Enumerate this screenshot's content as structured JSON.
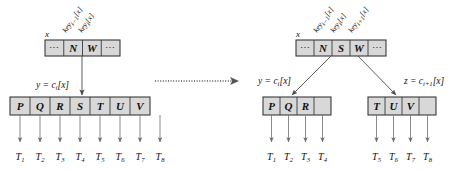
{
  "figure": {
    "title": "B-tree node split diagram",
    "transition_arrow": "dotted-right-arrow",
    "colors": {
      "box_fill": "#d8d8d8",
      "box_stroke": "#3a3a3a",
      "edge": "#4a4a4a",
      "leaf_pointer": "#6e6e6e",
      "text": "#111111",
      "background": "#ffffff"
    },
    "ellipsis": "⋯"
  },
  "left_panel": {
    "name": "before-split",
    "pointer_label": "x",
    "key_labels": [
      {
        "text": "key",
        "sub": "i−1",
        "suffix": "[x]"
      },
      {
        "text": "key",
        "sub": "i",
        "suffix": "[x]"
      }
    ],
    "parent_node": {
      "name": "parent-node",
      "cells": [
        "N",
        "W"
      ],
      "lead_ellipsis": "⋯",
      "trail_ellipsis": "⋯"
    },
    "child_edge_label": {
      "lhs": "y",
      "eq": "=",
      "rhs": "c",
      "sub": "i",
      "suffix": "[x]"
    },
    "child_node": {
      "name": "child-node-full",
      "cells": [
        "P",
        "Q",
        "R",
        "S",
        "T",
        "U",
        "V"
      ]
    },
    "leaves": [
      {
        "text": "T",
        "sub": "1"
      },
      {
        "text": "T",
        "sub": "2"
      },
      {
        "text": "T",
        "sub": "3"
      },
      {
        "text": "T",
        "sub": "4"
      },
      {
        "text": "T",
        "sub": "5"
      },
      {
        "text": "T",
        "sub": "6"
      },
      {
        "text": "T",
        "sub": "7"
      },
      {
        "text": "T",
        "sub": "8"
      }
    ]
  },
  "right_panel": {
    "name": "after-split",
    "pointer_label": "x",
    "key_labels": [
      {
        "text": "key",
        "sub": "i−1",
        "suffix": "[x]"
      },
      {
        "text": "key",
        "sub": "i",
        "suffix": "[x]"
      },
      {
        "text": "key",
        "sub": "i+1",
        "suffix": "[x]"
      }
    ],
    "parent_node": {
      "name": "parent-node",
      "cells": [
        "N",
        "S",
        "W"
      ],
      "lead_ellipsis": "⋯",
      "trail_ellipsis": "⋯"
    },
    "left_edge_label": {
      "lhs": "y",
      "eq": "=",
      "rhs": "c",
      "sub": "i",
      "suffix": "[x]"
    },
    "right_edge_label": {
      "lhs": "z",
      "eq": "=",
      "rhs": "c",
      "sub": "i+1",
      "suffix": "[x]"
    },
    "left_child": {
      "name": "child-node-left",
      "cells": [
        "P",
        "Q",
        "R"
      ]
    },
    "right_child": {
      "name": "child-node-right",
      "cells": [
        "T",
        "U",
        "V"
      ]
    },
    "left_leaves": [
      {
        "text": "T",
        "sub": "1"
      },
      {
        "text": "T",
        "sub": "2"
      },
      {
        "text": "T",
        "sub": "3"
      },
      {
        "text": "T",
        "sub": "4"
      }
    ],
    "right_leaves": [
      {
        "text": "T",
        "sub": "5"
      },
      {
        "text": "T",
        "sub": "6"
      },
      {
        "text": "T",
        "sub": "7"
      },
      {
        "text": "T",
        "sub": "8"
      }
    ]
  }
}
